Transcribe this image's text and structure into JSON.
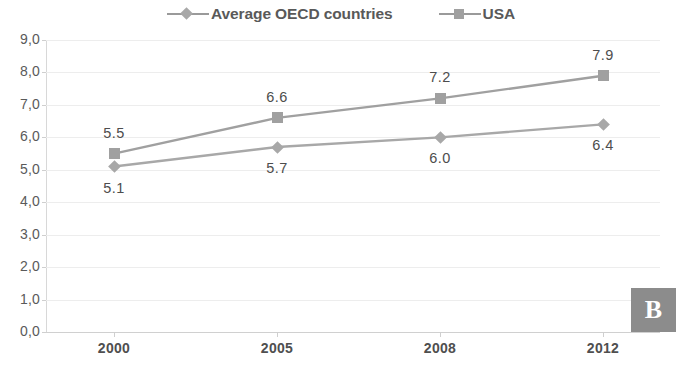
{
  "legend": {
    "entries": [
      {
        "label": "Average OECD countries",
        "marker": "diamond-marker-icon"
      },
      {
        "label": "USA",
        "marker": "square-marker-icon"
      }
    ]
  },
  "panel_tag": "B",
  "chart_data": {
    "type": "line",
    "title": "",
    "xlabel": "",
    "ylabel": "",
    "categories": [
      "2000",
      "2005",
      "2008",
      "2012"
    ],
    "ytick_labels": [
      "0,0",
      "1,0",
      "2,0",
      "3,0",
      "4,0",
      "5,0",
      "6,0",
      "7,0",
      "8,0",
      "9,0"
    ],
    "yticks": [
      0,
      1,
      2,
      3,
      4,
      5,
      6,
      7,
      8,
      9
    ],
    "ylim": [
      0,
      9
    ],
    "grid": true,
    "legend_position": "top-center",
    "series": [
      {
        "name": "Average OECD countries",
        "marker": "diamond",
        "color": "#a8a8a8",
        "values": [
          5.1,
          5.7,
          6.0,
          6.4
        ],
        "point_labels": [
          "5.1",
          "5.7",
          "6.0",
          "6.4"
        ],
        "label_position": "below"
      },
      {
        "name": "USA",
        "marker": "square",
        "color": "#a0a0a0",
        "values": [
          5.5,
          6.6,
          7.2,
          7.9
        ],
        "point_labels": [
          "5.5",
          "6.6",
          "7.2",
          "7.9"
        ],
        "label_position": "above"
      }
    ]
  }
}
